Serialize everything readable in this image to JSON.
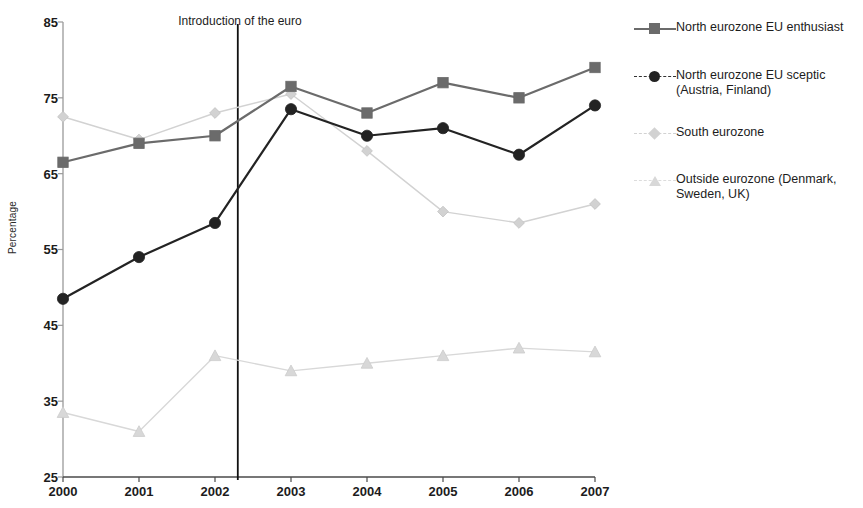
{
  "chart_data": {
    "type": "line",
    "title": "",
    "xlabel": "",
    "ylabel": "Percentage",
    "categories": [
      "2000",
      "2001",
      "2002",
      "2003",
      "2004",
      "2005",
      "2006",
      "2007"
    ],
    "x": [
      2000,
      2001,
      2002,
      2003,
      2004,
      2005,
      2006,
      2007
    ],
    "xlim": [
      2000,
      2007
    ],
    "ylim": [
      25,
      85
    ],
    "yticks": [
      25,
      35,
      45,
      55,
      65,
      75,
      85
    ],
    "xticks": [
      "2000",
      "2001",
      "2002",
      "2003",
      "2004",
      "2005",
      "2006",
      "2007"
    ],
    "grid": false,
    "legend_position": "right",
    "series": [
      {
        "name": "North eurozone EU enthusiast",
        "marker": "square",
        "color": "#6b6b6b",
        "values": [
          66.5,
          69,
          70,
          76.5,
          73,
          77,
          75,
          79
        ]
      },
      {
        "name": "North eurozone EU sceptic (Austria, Finland)",
        "marker": "circle",
        "color": "#232323",
        "values": [
          48.5,
          54,
          58.5,
          73.5,
          70,
          71,
          67.5,
          74
        ]
      },
      {
        "name": "South eurozone",
        "marker": "diamond",
        "color": "#d2d2d2",
        "values": [
          72.5,
          69.5,
          73,
          75.5,
          68,
          60,
          58.5,
          61
        ]
      },
      {
        "name": "Outside eurozone (Denmark, Sweden, UK)",
        "marker": "triangle",
        "color": "#d8d8d8",
        "values": [
          33.5,
          31,
          41,
          39,
          40,
          41,
          42,
          41.5
        ]
      }
    ],
    "annotations": [
      {
        "text": "Introduction of the euro",
        "type": "vertical-line",
        "x": 2002.3
      }
    ]
  },
  "axis": {
    "y_title": "Percentage",
    "y_labels": [
      "85",
      "75",
      "65",
      "55",
      "45",
      "35",
      "25"
    ],
    "x_labels": [
      "2000",
      "2001",
      "2002",
      "2003",
      "2004",
      "2005",
      "2006",
      "2007"
    ]
  },
  "annotation": {
    "euro_label": "Introduction of the euro"
  },
  "legend": {
    "entries": [
      {
        "label": "North eurozone EU enthusiast",
        "marker": "square-marker",
        "color": "#6b6b6b"
      },
      {
        "label": "North eurozone EU sceptic\n(Austria, Finland)",
        "marker": "circle-marker",
        "color": "#232323"
      },
      {
        "label": "South eurozone",
        "marker": "diamond-marker",
        "color": "#d2d2d2"
      },
      {
        "label": "Outside eurozone (Denmark,\nSweden, UK)",
        "marker": "triangle-marker",
        "color": "#d8d8d8"
      }
    ]
  }
}
